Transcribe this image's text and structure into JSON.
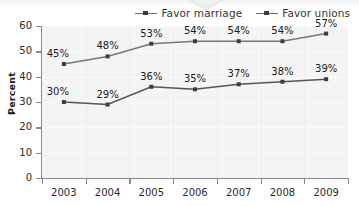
{
  "chart_data": {
    "type": "line",
    "title": "",
    "subtitle": "",
    "xlabel": "",
    "ylabel": "Percent",
    "categories": [
      "2003",
      "2004",
      "2005",
      "2006",
      "2007",
      "2008",
      "2009"
    ],
    "x": [
      2003,
      2004,
      2005,
      2006,
      2007,
      2008,
      2009
    ],
    "ylim": [
      0,
      60
    ],
    "yticks": [
      0,
      10,
      20,
      30,
      40,
      50,
      60
    ],
    "ytick_labels": [
      "0",
      "10",
      "20",
      "30",
      "40",
      "50",
      "60"
    ],
    "grid": true,
    "legend_position": "top-right",
    "series": [
      {
        "name": "Favor marriage",
        "values": [
          30,
          29,
          36,
          35,
          37,
          38,
          39
        ],
        "data_labels": [
          "30%",
          "29%",
          "36%",
          "35%",
          "37%",
          "38%",
          "39%"
        ],
        "color": "#555555",
        "marker": "square"
      },
      {
        "name": "Favor unions",
        "values": [
          45,
          48,
          53,
          54,
          54,
          54,
          57
        ],
        "data_labels": [
          "45%",
          "48%",
          "53%",
          "54%",
          "54%",
          "54%",
          "57%"
        ],
        "color": "#777777",
        "marker": "square"
      }
    ]
  },
  "legend": {
    "items": [
      {
        "label": "Favor marriage"
      },
      {
        "label": "Favor unions"
      }
    ]
  },
  "axes": {
    "y_title": "Percent",
    "y_tick_labels": [
      "60",
      "50",
      "40",
      "30",
      "20",
      "10",
      "0"
    ],
    "x_tick_labels": [
      "2003",
      "2004",
      "2005",
      "2006",
      "2007",
      "2008",
      "2009"
    ]
  },
  "colors": {
    "plot_background": "#f4f4f4",
    "axis": "#8a8a8a",
    "line_marriage": "#555555",
    "line_unions": "#777777",
    "text": "#2b2b2b"
  }
}
